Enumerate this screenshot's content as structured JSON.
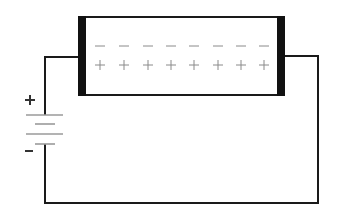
{
  "diagram": {
    "type": "circuit",
    "colors": {
      "wire": "#1a1a1a",
      "plate": "#111111",
      "charge_marks": "#8a8a8a",
      "battery_lines": "#9a9a9a",
      "background": "#ffffff"
    },
    "capacitor": {
      "negative_charges": [
        "−",
        "−",
        "−",
        "−",
        "−",
        "−",
        "−",
        "−"
      ],
      "positive_charges": [
        "+",
        "+",
        "+",
        "+",
        "+",
        "+",
        "+",
        "+"
      ],
      "charge_x": [
        100,
        124,
        148,
        171,
        194,
        218,
        241,
        264
      ]
    },
    "battery": {
      "positive_label": "+",
      "negative_label": "−",
      "cells": 2
    }
  }
}
